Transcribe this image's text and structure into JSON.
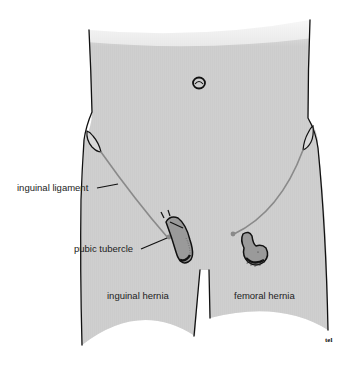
{
  "figure": {
    "colors": {
      "skin": "#cfcfcf",
      "outline": "#111111",
      "ligament": "#8a8a8a",
      "hernia_fill": "#9a9a9a",
      "background": "#ffffff"
    }
  },
  "labels": {
    "inguinal_ligament": "inguinal ligament",
    "pubic_tubercle": "pubic tubercle",
    "inguinal_hernia": "inguinal hernia",
    "femoral_hernia": "femoral hernia",
    "signature": "tel"
  }
}
